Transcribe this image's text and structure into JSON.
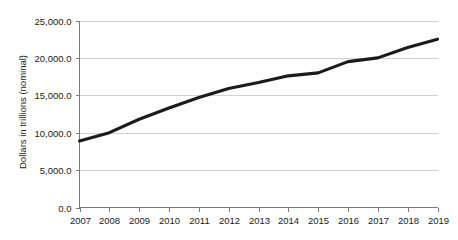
{
  "chart_data": {
    "type": "line",
    "title": "",
    "xlabel": "",
    "ylabel": "Dollars in trillions (nominal)",
    "categories": [
      "2007",
      "2008",
      "2009",
      "2010",
      "2011",
      "2012",
      "2013",
      "2014",
      "2015",
      "2016",
      "2017",
      "2018",
      "2019"
    ],
    "x": [
      2007,
      2008,
      2009,
      2010,
      2011,
      2012,
      2013,
      2014,
      2015,
      2016,
      2017,
      2018,
      2019
    ],
    "values": [
      8900,
      10000,
      11800,
      13300,
      14700,
      15900,
      16700,
      17600,
      18000,
      19500,
      20000,
      21400,
      22500
    ],
    "series": [
      {
        "name": "Dollars in trillions (nominal)",
        "values": [
          8900,
          10000,
          11800,
          13300,
          14700,
          15900,
          16700,
          17600,
          18000,
          19500,
          20000,
          21400,
          22500
        ]
      }
    ],
    "ylim": [
      0,
      25000
    ],
    "xlim": [
      2007,
      2019
    ],
    "y_ticks": [
      0,
      5000,
      10000,
      15000,
      20000,
      25000
    ],
    "y_tick_labels": [
      "0.0",
      "5,000.0",
      "10,000.0",
      "15,000.0",
      "20,000.0",
      "25,000.0"
    ],
    "x_tick_labels": [
      "2007",
      "2008",
      "2009",
      "2010",
      "2011",
      "2012",
      "2013",
      "2014",
      "2015",
      "2016",
      "2017",
      "2018",
      "2019"
    ],
    "grid": true,
    "grid_axis": "y",
    "legend": false,
    "legend_position": "none",
    "colors": {
      "line": "#1b1b1b",
      "grid": "#d2d2d2",
      "axis": "#7a7a7a",
      "text": "#1a1a1a",
      "background": "#ffffff"
    }
  }
}
